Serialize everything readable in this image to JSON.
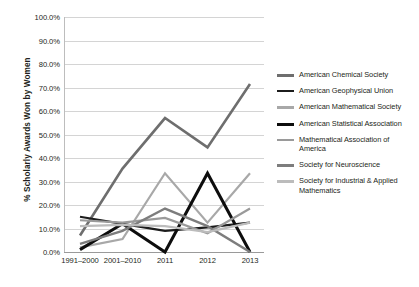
{
  "chart_data": {
    "type": "line",
    "title": "",
    "xlabel": "",
    "ylabel": "% Scholarly Awards Won by Women",
    "categories": [
      "1991–2000",
      "2001–2010",
      "2011",
      "2012",
      "2013"
    ],
    "ylim": [
      0,
      100
    ],
    "ytick_labels": [
      "100.0%",
      "90.0%",
      "80.0%",
      "70.0%",
      "60.0%",
      "50.0%",
      "40.0%",
      "30.0%",
      "20.0%",
      "10.0%",
      "0.0%"
    ],
    "ytick_values": [
      100,
      90,
      80,
      70,
      60,
      50,
      40,
      30,
      20,
      10,
      0
    ],
    "grid": "horizontal",
    "legend_position": "right",
    "series": [
      {
        "name": "American Chemical Society",
        "color": "#6e6e6e",
        "width": 2.6,
        "values": [
          7.0,
          35.5,
          57.0,
          44.5,
          71.5
        ]
      },
      {
        "name": "American Geophysical Union",
        "color": "#1c1c1c",
        "width": 2.2,
        "values": [
          15.0,
          12.0,
          9.0,
          10.5,
          12.5
        ]
      },
      {
        "name": "American Mathematical Society",
        "color": "#a8a8a8",
        "width": 2.2,
        "values": [
          2.0,
          5.5,
          33.5,
          12.5,
          33.5
        ]
      },
      {
        "name": "American Statistical Association",
        "color": "#0d0d0d",
        "width": 3.0,
        "values": [
          1.0,
          12.0,
          0.0,
          33.5,
          0.0
        ]
      },
      {
        "name": "Mathematical Association of America",
        "color": "#9a9a9a",
        "width": 2.2,
        "values": [
          13.5,
          12.5,
          14.5,
          8.0,
          18.5
        ]
      },
      {
        "name": "Society for Neuroscience",
        "color": "#7d7d7d",
        "width": 2.4,
        "values": [
          3.5,
          9.0,
          18.5,
          11.0,
          0.0
        ]
      },
      {
        "name": "Society for Industrial & Applied Mathematics",
        "color": "#bcbcbc",
        "width": 2.2,
        "values": [
          11.0,
          11.5,
          11.0,
          8.5,
          12.5
        ]
      }
    ]
  },
  "legend": {
    "items": [
      {
        "label": "American Chemical Society"
      },
      {
        "label": "American Geophysical Union"
      },
      {
        "label": "American Mathematical Society"
      },
      {
        "label": "American Statistical Association"
      },
      {
        "label": "Mathematical Association of America"
      },
      {
        "label": "Society for Neuroscience"
      },
      {
        "label": "Society for Industrial & Applied Mathematics"
      }
    ]
  }
}
